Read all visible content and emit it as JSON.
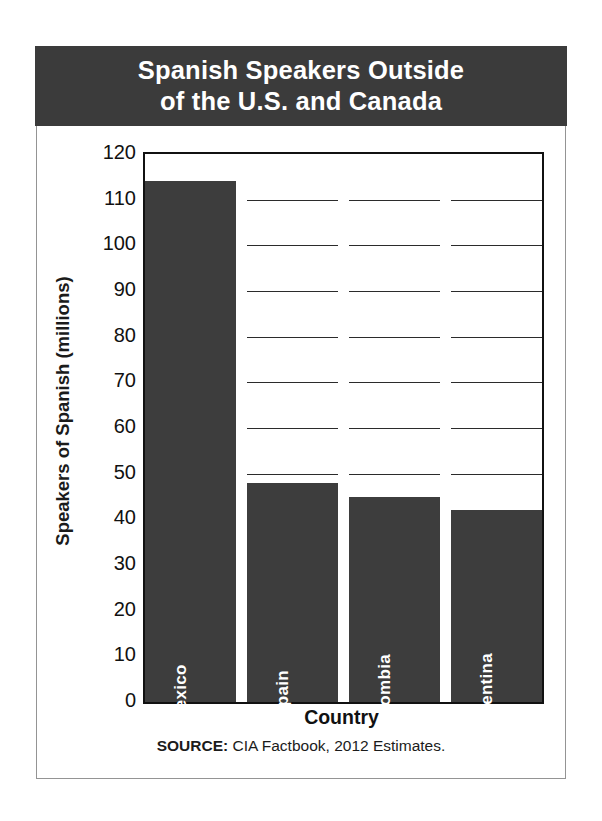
{
  "title": {
    "line1": "Spanish Speakers Outside",
    "line2": "of the U.S. and Canada"
  },
  "source": {
    "prefix": "SOURCE:",
    "text": "CIA Factbook, 2012 Estimates."
  },
  "colors": {
    "banner": "#3b3b3b",
    "bar": "#3d3d3d",
    "axis": "#111111",
    "card_border": "#949494",
    "bar_label": "#ffffff"
  },
  "chart_data": {
    "type": "bar",
    "title": "Spanish Speakers Outside of the U.S. and Canada",
    "xlabel": "Country",
    "ylabel": "Speakers of Spanish (millions)",
    "categories": [
      "Mexico",
      "Spain",
      "Colombia",
      "Argentina"
    ],
    "values": [
      114,
      48,
      45,
      42
    ],
    "ylim": [
      0,
      120
    ],
    "ytick_step": 10,
    "yticks": [
      0,
      10,
      20,
      30,
      40,
      50,
      60,
      70,
      80,
      90,
      100,
      110,
      120
    ],
    "ytick_labels": [
      "0",
      "10",
      "20",
      "30",
      "40",
      "50",
      "60",
      "70",
      "80",
      "90",
      "100",
      "110",
      "120"
    ],
    "grid": true,
    "grid_axis": "y",
    "legend": false,
    "legend_position": "none",
    "bar_labels_inside": true,
    "bar_label_rotation": -90,
    "series": [
      {
        "name": "Speakers of Spanish (millions)",
        "values": [
          114,
          48,
          45,
          42
        ]
      }
    ]
  }
}
